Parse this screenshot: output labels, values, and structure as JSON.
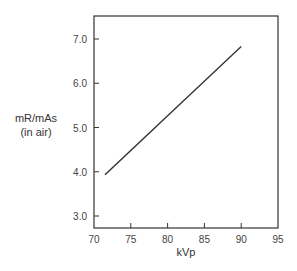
{
  "chart_data": {
    "type": "line",
    "title": "",
    "xlabel": "kVp",
    "ylabel": [
      "mR/mAs",
      "(in air)"
    ],
    "xlim": [
      70,
      95
    ],
    "ylim": [
      2.75,
      7.5
    ],
    "xticks": [
      70,
      75,
      80,
      85,
      90,
      95
    ],
    "xtick_labels": [
      "70",
      "75",
      "80",
      "85",
      "90",
      "95"
    ],
    "yticks": [
      3.0,
      4.0,
      5.0,
      6.0,
      7.0
    ],
    "ytick_labels": [
      "3.0",
      "4.0",
      "5.0",
      "6.0",
      "7.0"
    ],
    "grid": false,
    "legend": null,
    "series": [
      {
        "name": "mR/mAs (in air)",
        "x": [
          71.5,
          90
        ],
        "y": [
          3.93,
          6.83
        ]
      }
    ]
  },
  "colors": {
    "axis": "#333333",
    "line": "#333333",
    "text": "#444444"
  }
}
